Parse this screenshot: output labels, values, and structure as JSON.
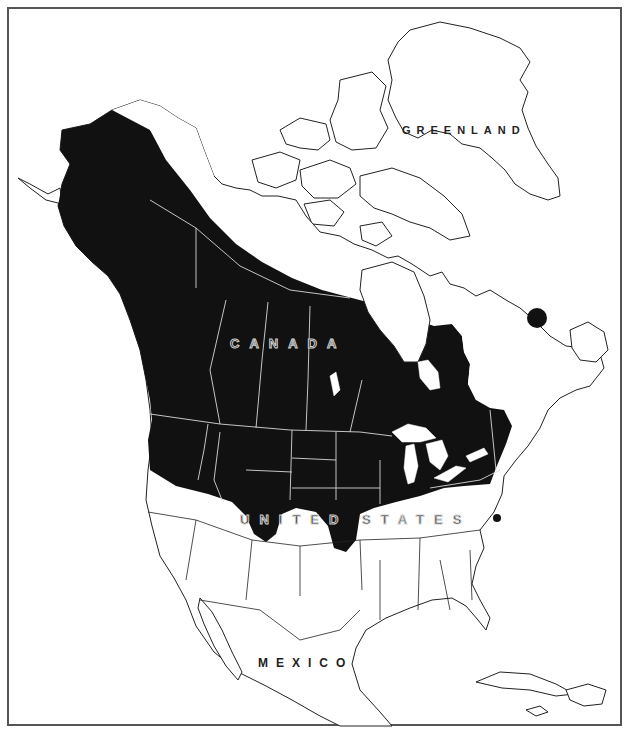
{
  "map": {
    "type": "species range map",
    "region": "North America",
    "range_fill_color": "#111111",
    "land_fill_color": "#ffffff",
    "outline_color": "#222222",
    "frame_color": "#555555"
  },
  "labels": {
    "greenland": "GREENLAND",
    "canada": "CANADA",
    "united_states": "UNITED STATES",
    "mexico": "MEXICO"
  }
}
